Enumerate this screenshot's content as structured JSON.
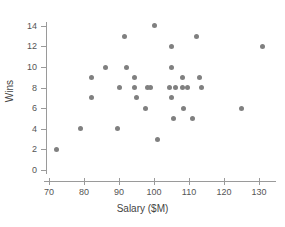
{
  "chart_data": {
    "type": "scatter",
    "title": "",
    "xlabel": "Salary ($M)",
    "ylabel": "Wins",
    "xlim": [
      66,
      136
    ],
    "ylim": [
      0,
      15
    ],
    "xticks": [
      70,
      80,
      90,
      100,
      110,
      120,
      130
    ],
    "yticks": [
      0,
      2,
      4,
      6,
      8,
      10,
      12,
      14
    ],
    "grid": false,
    "legend": null,
    "marker": {
      "shape": "circle",
      "color": "#808080",
      "size": 5
    },
    "points": [
      {
        "x": 72,
        "y": 2
      },
      {
        "x": 79,
        "y": 4
      },
      {
        "x": 82,
        "y": 9
      },
      {
        "x": 82,
        "y": 7
      },
      {
        "x": 86,
        "y": 10
      },
      {
        "x": 89.5,
        "y": 4
      },
      {
        "x": 90,
        "y": 8
      },
      {
        "x": 91.5,
        "y": 13
      },
      {
        "x": 92,
        "y": 10
      },
      {
        "x": 94.5,
        "y": 9
      },
      {
        "x": 94.5,
        "y": 8
      },
      {
        "x": 95,
        "y": 7
      },
      {
        "x": 97.5,
        "y": 6
      },
      {
        "x": 98,
        "y": 8
      },
      {
        "x": 99,
        "y": 8
      },
      {
        "x": 100,
        "y": 14
      },
      {
        "x": 101,
        "y": 3
      },
      {
        "x": 105,
        "y": 12
      },
      {
        "x": 105,
        "y": 10
      },
      {
        "x": 104.5,
        "y": 8
      },
      {
        "x": 105,
        "y": 7
      },
      {
        "x": 105.5,
        "y": 5
      },
      {
        "x": 106,
        "y": 8
      },
      {
        "x": 108,
        "y": 9
      },
      {
        "x": 108,
        "y": 8
      },
      {
        "x": 109.5,
        "y": 8
      },
      {
        "x": 108.5,
        "y": 6
      },
      {
        "x": 111,
        "y": 5
      },
      {
        "x": 112,
        "y": 13
      },
      {
        "x": 113,
        "y": 9
      },
      {
        "x": 113.5,
        "y": 8
      },
      {
        "x": 125,
        "y": 6
      },
      {
        "x": 131,
        "y": 12
      }
    ]
  }
}
